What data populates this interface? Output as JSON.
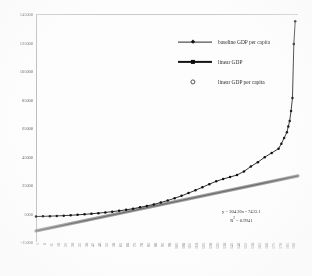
{
  "chart_data": {
    "type": "line",
    "title": "",
    "xlabel": "",
    "ylabel": "",
    "ylim": [
      -15000,
      145000
    ],
    "xlim": [
      1,
      190
    ],
    "grid": false,
    "legend_position": "top-right-inside",
    "y_ticks": [
      "145000",
      "125000",
      "105000",
      "85000",
      "65000",
      "45000",
      "25000",
      "5000",
      "-15000"
    ],
    "y_tick_values": [
      145000,
      125000,
      105000,
      85000,
      65000,
      45000,
      25000,
      5000,
      -15000
    ],
    "x_ticks": [
      "1",
      "6",
      "11",
      "16",
      "21",
      "26",
      "31",
      "36",
      "41",
      "46",
      "51",
      "56",
      "61",
      "66",
      "71",
      "76",
      "81",
      "86",
      "91",
      "96",
      "101",
      "106",
      "111",
      "116",
      "121",
      "126",
      "131",
      "136",
      "141",
      "146",
      "151",
      "156",
      "161",
      "166",
      "171",
      "176",
      "181",
      "186"
    ],
    "annotations": [
      {
        "name": "trendline-equation",
        "line1": "y = 204.26x - 7433.1",
        "line2_prefix": "R",
        "line2_sup": "2",
        "line2_suffix": " = 0.9941"
      }
    ],
    "series": [
      {
        "name": "baseline GDP per capita",
        "marker": "diamond",
        "color": "#111111",
        "x": [
          1,
          6,
          11,
          16,
          21,
          26,
          31,
          36,
          41,
          46,
          51,
          56,
          61,
          66,
          71,
          76,
          81,
          86,
          91,
          96,
          101,
          106,
          111,
          116,
          121,
          126,
          131,
          136,
          141,
          146,
          151,
          156,
          161,
          166,
          171,
          176,
          178,
          180,
          182,
          183,
          184,
          185,
          186,
          187,
          188
        ],
        "values": [
          2900,
          3000,
          3150,
          3300,
          3500,
          3750,
          4050,
          4400,
          4800,
          5250,
          5750,
          6300,
          6900,
          7600,
          8400,
          9300,
          10300,
          11400,
          12700,
          14100,
          15700,
          17400,
          19300,
          21300,
          23400,
          25600,
          27600,
          29200,
          30600,
          32000,
          34500,
          38000,
          41000,
          44500,
          47500,
          50500,
          54000,
          58000,
          62000,
          66000,
          70000,
          77000,
          86000,
          124000,
          140000
        ]
      },
      {
        "name": "linear GDP",
        "marker": "square",
        "color": "#6e6e6e",
        "x": [
          1,
          190
        ],
        "values": [
          -7229,
          31376
        ]
      },
      {
        "name": "linear GDP per capita",
        "marker": "open-circle",
        "color": "#555555",
        "x": [],
        "values": []
      }
    ]
  },
  "legend": {
    "items": [
      {
        "key": "baseline-gdp-per-capita",
        "label": "baseline GDP per capita",
        "marker": "diamond"
      },
      {
        "key": "linear-gdp",
        "label": "linear GDP",
        "marker": "square"
      },
      {
        "key": "linear-gdp-per-capita",
        "label": "linear GDP per capita",
        "marker": "open-circle"
      }
    ]
  },
  "colors": {
    "baseline": "#111111",
    "linear": "#6e6e6e",
    "axis": "#c9c9c9",
    "text": "#3a3a3a",
    "background": "#fdfdfd"
  }
}
